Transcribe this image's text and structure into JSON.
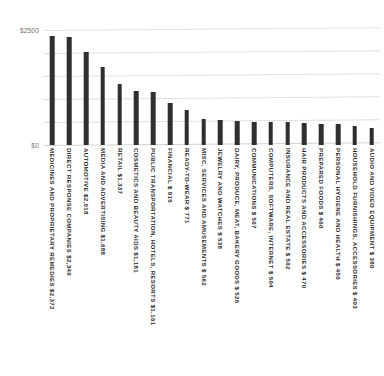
{
  "chart_data": {
    "type": "bar",
    "title": "",
    "xlabel": "",
    "ylabel": "",
    "ylim": [
      0,
      2500
    ],
    "grid": true,
    "legend": null,
    "orientation": "vertical",
    "y_ticks": [
      0,
      500,
      1000,
      1500,
      2000,
      2500
    ],
    "y_tick_labels": [
      "$0",
      "",
      "",
      "",
      "",
      "$2500"
    ],
    "axis_labels_shown": [
      "$2500",
      "$0"
    ],
    "bar_color": "#2f2f2f",
    "gridline_color": "#dfdfdf",
    "background_color": "#ffffff",
    "label_rotation": 90,
    "categories": [
      "MEDICINES AND PROPRIETARY REMEDIES",
      "DIRECT RESPONSE COMPANIES",
      "AUTOMOTIVE",
      "MEDIA AND ADVERTISING",
      "RETAIL",
      "COSMETICS AND BEAUTY AIDS",
      "PUBLIC TRANSPORTATION, HOTELS, RESORTS",
      "FINANCIAL",
      "READY-TO-WEAR",
      "MISC. SERVICES AND AMUSEMENTS",
      "JEWELRY AND WATCHES",
      "DAIRY, PRODUCE, MEAT, BAKERY GOODS",
      "COMMUNICATIONS",
      "COMPUTERS, SOFTWARE, INTERNET",
      "INSURANCE AND REAL ESTATE",
      "HAIR PRODUCTS AND ACCESSORIES",
      "PREPARED FOODS",
      "PERSONAL HYGIENE AND HEALTH",
      "HOUSEHOLD FURNISHINGS, ACCESSORIES",
      "AUDIO AND VIDEO EQUIPMENT"
    ],
    "values": [
      2372,
      2340,
      2018,
      1688,
      1337,
      1181,
      1161,
      915,
      771,
      562,
      538,
      526,
      507,
      504,
      502,
      470,
      460,
      450,
      403,
      380
    ],
    "value_labels": [
      "$2,372",
      "$2,340",
      "$2,018",
      "$1,688",
      "$1,337",
      "$1,181",
      "$1,161",
      "$ 915",
      "$ 771",
      "$ 562",
      "$ 538",
      "$ 526",
      "$ 507",
      "$ 504",
      "$ 502",
      "$ 470",
      "$ 460",
      "$ 450",
      "$ 403",
      "$ 380"
    ],
    "axis_tick_labels": [
      {
        "value": 2500,
        "label": "$2500"
      },
      {
        "value": 0,
        "label": "$0"
      }
    ],
    "bars": [
      {
        "category": "MEDICINES AND PROPRIETARY REMEDIES",
        "value": 2372,
        "value_label": "$2,372",
        "full_label": "MEDICINES AND PROPRIETARY REMEDIES $2,372"
      },
      {
        "category": "DIRECT RESPONSE COMPANIES",
        "value": 2340,
        "value_label": "$2,340",
        "full_label": "DIRECT RESPONSE COMPANIES $2,340"
      },
      {
        "category": "AUTOMOTIVE",
        "value": 2018,
        "value_label": "$2,018",
        "full_label": "AUTOMOTIVE $2,018"
      },
      {
        "category": "MEDIA AND ADVERTISING",
        "value": 1688,
        "value_label": "$1,688",
        "full_label": "MEDIA AND ADVERTISING $1,688"
      },
      {
        "category": "RETAIL",
        "value": 1337,
        "value_label": "$1,337",
        "full_label": "RETAIL $1,337"
      },
      {
        "category": "COSMETICS AND BEAUTY AIDS",
        "value": 1181,
        "value_label": "$1,181",
        "full_label": "COSMETICS AND BEAUTY AIDS $1,181"
      },
      {
        "category": "PUBLIC TRANSPORTATION, HOTELS, RESORTS",
        "value": 1161,
        "value_label": "$1,161",
        "full_label": "PUBLIC TRANSPORTATION, HOTELS, RESORTS $1,161"
      },
      {
        "category": "FINANCIAL",
        "value": 915,
        "value_label": "$ 915",
        "full_label": "FINANCIAL $  915"
      },
      {
        "category": "READY-TO-WEAR",
        "value": 771,
        "value_label": "$ 771",
        "full_label": "READY-TO-WEAR $  771"
      },
      {
        "category": "MISC. SERVICES AND AMUSEMENTS",
        "value": 562,
        "value_label": "$ 562",
        "full_label": "MISC. SERVICES AND AMUSEMENTS $  562"
      },
      {
        "category": "JEWELRY AND WATCHES",
        "value": 538,
        "value_label": "$ 538",
        "full_label": "JEWELRY AND WATCHES $  538"
      },
      {
        "category": "DAIRY, PRODUCE, MEAT, BAKERY GOODS",
        "value": 526,
        "value_label": "$ 526",
        "full_label": "DAIRY, PRODUCE, MEAT, BAKERY GOODS $  526"
      },
      {
        "category": "COMMUNICATIONS",
        "value": 507,
        "value_label": "$ 507",
        "full_label": "COMMUNICATIONS $  507"
      },
      {
        "category": "COMPUTERS, SOFTWARE, INTERNET",
        "value": 504,
        "value_label": "$ 504",
        "full_label": "COMPUTERS, SOFTWARE, INTERNET $  504"
      },
      {
        "category": "INSURANCE AND REAL ESTATE",
        "value": 502,
        "value_label": "$ 502",
        "full_label": "INSURANCE AND REAL ESTATE $  502"
      },
      {
        "category": "HAIR PRODUCTS AND ACCESSORIES",
        "value": 470,
        "value_label": "$ 470",
        "full_label": "HAIR PRODUCTS AND ACCESSORIES $  470"
      },
      {
        "category": "PREPARED FOODS",
        "value": 460,
        "value_label": "$ 460",
        "full_label": "PREPARED FOODS $  460"
      },
      {
        "category": "PERSONAL HYGIENE AND HEALTH",
        "value": 450,
        "value_label": "$ 450",
        "full_label": "PERSONAL HYGIENE AND HEALTH $  450"
      },
      {
        "category": "HOUSEHOLD FURNISHINGS, ACCESSORIES",
        "value": 403,
        "value_label": "$ 403",
        "full_label": "HOUSEHOLD FURNISHINGS, ACCESSORIES $  403"
      },
      {
        "category": "AUDIO AND VIDEO EQUIPMENT",
        "value": 380,
        "value_label": "$ 380",
        "full_label": "AUDIO AND VIDEO EQUIPMENT $  380"
      }
    ]
  }
}
